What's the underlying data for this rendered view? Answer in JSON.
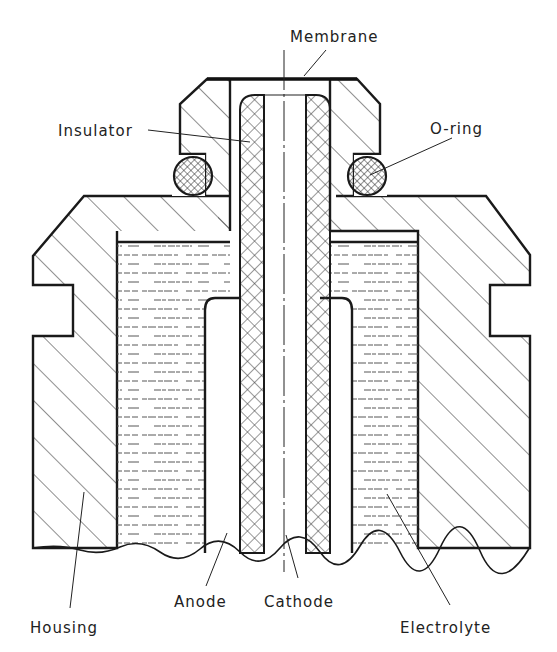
{
  "diagram": {
    "labels": {
      "membrane": "Membrane",
      "insulator": "Insulator",
      "oring": "O-ring",
      "housing": "Housing",
      "anode": "Anode",
      "cathode": "Cathode",
      "electrolyte": "Electrolyte"
    },
    "colors": {
      "line": "#1a1a1a",
      "background": "#ffffff"
    }
  }
}
